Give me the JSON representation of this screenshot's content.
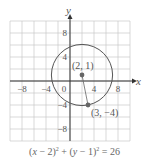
{
  "chart_data": {
    "type": "scatter",
    "title": "",
    "xlabel": "x",
    "ylabel": "y",
    "xlim": [
      -10,
      10
    ],
    "ylim": [
      -10,
      10
    ],
    "grid": true,
    "x_ticks": [
      -8,
      -4,
      0,
      4,
      8
    ],
    "y_ticks": [
      8,
      4,
      -4,
      -8
    ],
    "x_tick_labels": [
      "−8",
      "−4",
      "0",
      "4",
      "8"
    ],
    "y_tick_labels": [
      "8",
      "4",
      "−4",
      "−8"
    ],
    "circle": {
      "center": [
        2,
        1
      ],
      "radius_squared": 26,
      "radius": 5.099
    },
    "points": [
      {
        "label": "(2, 1)",
        "x": 2,
        "y": 1
      },
      {
        "label": "(3, −4)",
        "x": 3,
        "y": -4
      }
    ],
    "segments": [
      {
        "from": [
          2,
          1
        ],
        "to": [
          3,
          -4
        ]
      }
    ],
    "equation": "(x − 2)² + (y − 1)² = 26"
  },
  "axes": {
    "x_label": "x",
    "y_label": "y"
  },
  "labels": {
    "center": "(2, 1)",
    "point": "(3, −4)"
  },
  "caption": {
    "part1": "(",
    "x": "x",
    "part2": " − 2)",
    "exp1": "2",
    "part3": " + (",
    "y": "y",
    "part4": " − 1)",
    "exp2": "2",
    "part5": " = 26"
  },
  "colors": {
    "grid": "#c8c8c8",
    "axis": "#333333",
    "circle": "#555555",
    "point": "#666666"
  }
}
